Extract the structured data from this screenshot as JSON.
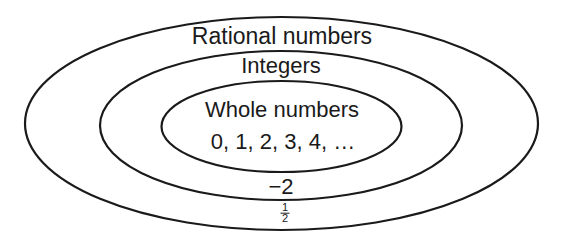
{
  "diagram": {
    "type": "nested-sets (Venn/Euler)",
    "stroke_color": "#1a1a1a",
    "background_color": "#ffffff",
    "sets": [
      {
        "name": "Rational numbers",
        "label": "Rational numbers",
        "ellipse": {
          "cx": 281.5,
          "cy": 123.5,
          "rx": 256.5,
          "ry": 106.5
        },
        "example_label": {
          "numerator": "1",
          "denominator": "2"
        }
      },
      {
        "name": "Integers",
        "label": "Integers",
        "ellipse": {
          "cx": 281,
          "cy": 125.5,
          "rx": 181,
          "ry": 74.5
        },
        "example_label": "−2"
      },
      {
        "name": "Whole numbers",
        "label": "Whole numbers",
        "ellipse": {
          "cx": 281.5,
          "cy": 126.5,
          "rx": 120,
          "ry": 45.5
        },
        "example_label": "0, 1, 2, 3, 4, …"
      }
    ]
  },
  "labels": {
    "rational": "Rational numbers",
    "integers": "Integers",
    "whole": "Whole numbers",
    "whole_examples": "0, 1, 2, 3, 4, …",
    "integer_example": "−2",
    "rational_example_numerator": "1",
    "rational_example_denominator": "2"
  }
}
